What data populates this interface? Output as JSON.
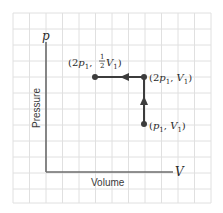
{
  "diagram": {
    "type": "pV-diagram",
    "axes": {
      "x_symbol": "V",
      "y_symbol": "p",
      "x_label": "Volume",
      "y_label": "Pressure"
    },
    "points": [
      {
        "id": "start",
        "prefix": "(",
        "coef": "",
        "p": "p",
        "p_sub": "1",
        "sep": ", ",
        "v": "V",
        "v_sub": "1",
        "suffix": ")"
      },
      {
        "id": "middle",
        "prefix": "(2",
        "p": "p",
        "p_sub": "1",
        "sep": ", ",
        "v": "V",
        "v_sub": "1",
        "suffix": ")"
      },
      {
        "id": "end",
        "prefix": "(2",
        "p": "p",
        "p_sub": "1",
        "sep": ", ",
        "frac_num": "1",
        "frac_den": "2",
        "v": "V",
        "v_sub": "1",
        "suffix": ")"
      }
    ],
    "process": [
      {
        "from": "(p1, V1)",
        "to": "(2p1, V1)",
        "direction": "up"
      },
      {
        "from": "(2p1, V1)",
        "to": "(2p1, 1/2 V1)",
        "direction": "left"
      }
    ],
    "colors": {
      "grid": "#dcdcdc",
      "axis": "#6b6b6b",
      "path": "#3c3c3c",
      "background": "#ffffff"
    }
  }
}
